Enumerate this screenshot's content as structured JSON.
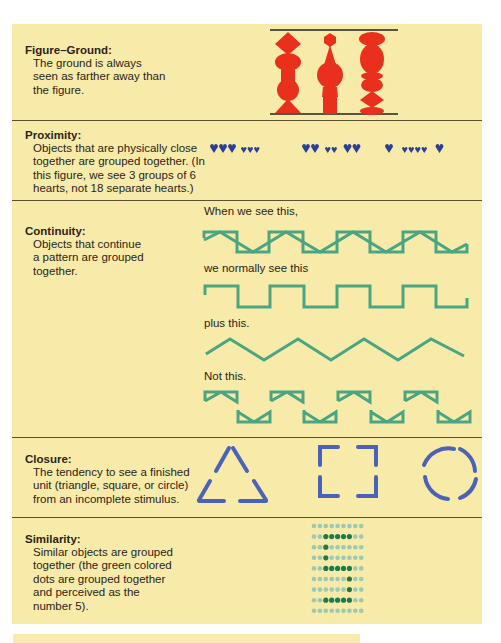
{
  "principles": [
    {
      "id": "figure-ground",
      "title": "Figure–Ground:",
      "lines": [
        "The ground is always",
        "seen as farther away than",
        "the figure."
      ]
    },
    {
      "id": "proximity",
      "title": "Proximity:",
      "lines": [
        "Objects that are physically close",
        "together are grouped together. (In",
        "this figure, we see 3 groups of 6",
        "hearts, not 18 separate hearts.)"
      ]
    },
    {
      "id": "continuity",
      "title": "Continuity:",
      "lines": [
        "Objects that continue",
        "a pattern are grouped",
        "together."
      ],
      "captions": [
        "When we see this,",
        "we normally see this",
        "plus this.",
        "Not this."
      ]
    },
    {
      "id": "closure",
      "title": "Closure:",
      "lines": [
        "The tendency to see a finished",
        "unit (triangle, square, or circle)",
        "from an incomplete stimulus."
      ],
      "shapes": [
        "triangle",
        "square",
        "circle"
      ]
    },
    {
      "id": "similarity",
      "title": "Similarity:",
      "lines": [
        "Similar objects are grouped",
        "together (the green colored",
        "dots are grouped together",
        "and perceived as the",
        "number 5)."
      ],
      "dot_grid": [
        "000000000",
        "001111100",
        "001000000",
        "001000000",
        "001111100",
        "000000100",
        "000000100",
        "001111100",
        "000000000"
      ]
    }
  ],
  "proximity_hearts": {
    "groups": [
      [
        "L",
        "L",
        "L",
        "s",
        "s",
        "s"
      ],
      [
        "L",
        "L",
        "s",
        "s",
        "L",
        "L"
      ],
      [
        "L",
        "s",
        "s",
        "s",
        "s",
        "L"
      ]
    ]
  },
  "colors": {
    "panel_bg": "#f8eaa8",
    "divider": "#5c5230",
    "figure_red": "#e8301c",
    "heart_blue": "#2a3f96",
    "continuity_green": "#4aa582",
    "closure_blue": "#4a63b8",
    "dot_light": "#9cc9b4",
    "dot_dark": "#1f7a4a"
  }
}
